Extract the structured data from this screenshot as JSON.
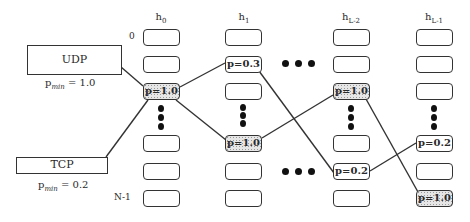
{
  "diagram": {
    "columns": [
      {
        "label": "h",
        "sub": "0"
      },
      {
        "label": "h",
        "sub": "1"
      },
      {
        "label": "h",
        "sub": "L-2"
      },
      {
        "label": "h",
        "sub": "L-1"
      }
    ],
    "row_labels": {
      "first": "0",
      "last": "N-1"
    },
    "protocols": [
      {
        "name": "UDP",
        "pmin_label": "p",
        "pmin_sub": "min",
        "pmin_value": " = 1.0"
      },
      {
        "name": "TCP",
        "pmin_label": "p",
        "pmin_sub": "min",
        "pmin_value": " = 0.2"
      }
    ],
    "cells": {
      "h0_r2": "p=1.0",
      "h1_r1": "p=0.3",
      "h1_r3": "p=1.0",
      "hL2_r2": "p=1.0",
      "hL2_r4": "p=0.2",
      "hL1_r3": "p=0.2",
      "hL1_r5": "p=1.0"
    },
    "edges": [
      {
        "from": "UDP",
        "to": "h0_r2"
      },
      {
        "from": "TCP",
        "to": "h0_r2"
      },
      {
        "from": "h0_r2",
        "to": "h1_r1"
      },
      {
        "from": "h0_r2",
        "to": "h1_r3"
      },
      {
        "from": "h1_r1",
        "to": "hL2_r4"
      },
      {
        "from": "h1_r3",
        "to": "hL2_r2"
      },
      {
        "from": "hL2_r2",
        "to": "hL1_r5"
      },
      {
        "from": "hL2_r4",
        "to": "hL1_r3"
      }
    ],
    "colors": {
      "line": "#333333",
      "highlight_fill": "#e6e6e6"
    }
  }
}
